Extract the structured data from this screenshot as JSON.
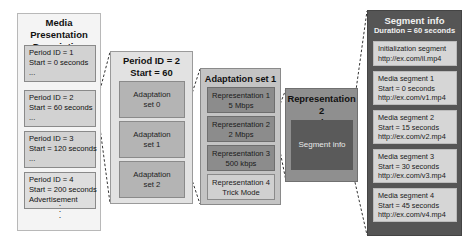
{
  "mpd": {
    "title_line1": "Media Presentation",
    "title_line2": "Description",
    "periods": [
      {
        "line1": "Period ID = 1",
        "line2": "Start = 0 seconds",
        "line3": "..."
      },
      {
        "line1": "Period ID = 2",
        "line2": "Start = 60 seconds",
        "line3": "..."
      },
      {
        "line1": "Period ID = 3",
        "line2": "Start = 120 seconds",
        "line3": "..."
      },
      {
        "line1": "Period ID = 4",
        "line2": "Start = 200 seconds",
        "line3": "Advertisement"
      }
    ],
    "more": ":"
  },
  "period": {
    "title_line1": "Period ID = 2",
    "title_line2": "Start = 60 seconds",
    "adaptation_sets": [
      {
        "line1": "Adaptation",
        "line2": "set 0"
      },
      {
        "line1": "Adaptation",
        "line2": "set 1"
      },
      {
        "line1": "Adaptation",
        "line2": "set 2"
      }
    ]
  },
  "adaptation_set": {
    "title": "Adaptation set 1",
    "representations": [
      {
        "line1": "Representation 1",
        "line2": "5 Mbps"
      },
      {
        "line1": "Representation 2",
        "line2": "2 Mbps"
      },
      {
        "line1": "Representation 3",
        "line2": "500 kbps"
      },
      {
        "line1": "Representation 4",
        "line2": "Trick Mode"
      }
    ]
  },
  "representation": {
    "title_line1": "Representation 2",
    "title_line2": "2 Mbps",
    "segment_info_label": "Segment info"
  },
  "segment_info": {
    "title": "Segment info",
    "subtitle": "Duration = 60 seconds",
    "segments": [
      {
        "line1": "Initialization segment",
        "line2": "http://ex.com/il.mp4"
      },
      {
        "line1": "Media segment 1",
        "line2": "Start = 0 seconds",
        "line3": "http://ex.com/v1.mp4"
      },
      {
        "line1": "Media segment 2",
        "line2": "Start = 15 seconds",
        "line3": "http://ex.com/v2.mp4"
      },
      {
        "line1": "Media segment 3",
        "line2": "Start = 30 seconds",
        "line3": "http://ex.com/v3.mp4"
      },
      {
        "line1": "Media segment 4",
        "line2": "Start = 45 seconds",
        "line3": "http://ex.com/v4.mp4"
      }
    ]
  },
  "colors": {
    "mpd_bg": "#f4f4f4",
    "period_box": "#d2d2d2",
    "period_panel": "#e2e2e2",
    "adaptation_box": "#b4b4b4",
    "adaptation_panel": "#c4c4c4",
    "representation_box": "#8c8c8c",
    "representation_panel": "#8f8f8f",
    "segment_inner": "#5a5a5a",
    "segment_panel": "#555555",
    "segment_box": "#d6d6d6"
  }
}
